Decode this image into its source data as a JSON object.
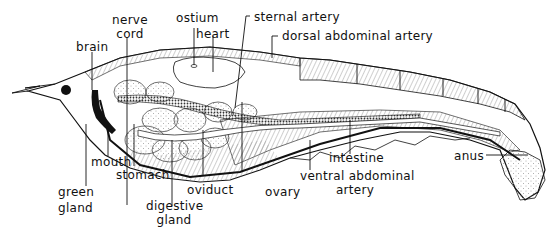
{
  "labels": {
    "brain": "brain",
    "nerve_cord_1": "nerve",
    "nerve_cord_2": "cord",
    "ostium": "ostium",
    "heart": "heart",
    "sternal_artery": "sternal artery",
    "dorsal_abdominal_artery": "dorsal abdominal artery",
    "mouth": "mouth",
    "green_gland_1": "green",
    "green_gland_2": "gland",
    "stomach": "stomach",
    "digestive_gland_1": "digestive",
    "digestive_gland_2": "gland",
    "oviduct": "oviduct",
    "ovary": "ovary",
    "intestine": "intestine",
    "ventral_abdominal_artery_1": "ventral abdominal",
    "ventral_abdominal_artery_2": "artery",
    "anus": "anus"
  },
  "colors": {
    "ink": "#111111",
    "background": "#ffffff",
    "shading": "#9a9a9a"
  }
}
